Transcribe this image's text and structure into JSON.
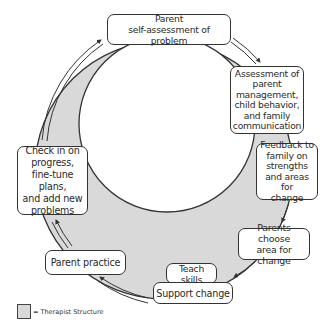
{
  "diagram": {
    "type": "cycle",
    "direction": "clockwise",
    "colors": {
      "therapist_structure_fill": "#d9d9d9",
      "stroke": "#333333",
      "background": "#ffffff"
    },
    "nodes": [
      {
        "id": "parent-self-assessment",
        "label": "Parent\nself-assessment of problem"
      },
      {
        "id": "assessment",
        "label": "Assessment of\nparent\nmanagement,\nchild behavior,\nand family\ncommunication"
      },
      {
        "id": "feedback",
        "label": "Feedback to\nfamily on\nstrengths\nand areas for\nchange"
      },
      {
        "id": "parents-choose",
        "label": "Parents choose\narea for change"
      },
      {
        "id": "teach-skills",
        "label": "Teach skills"
      },
      {
        "id": "support-change",
        "label": "Support change"
      },
      {
        "id": "parent-practice",
        "label": "Parent practice"
      },
      {
        "id": "check-in",
        "label": "Check in on\nprogress,\nfine-tune plans,\nand add new\nproblems"
      }
    ],
    "edges": [
      [
        "parent-self-assessment",
        "assessment"
      ],
      [
        "assessment",
        "feedback"
      ],
      [
        "feedback",
        "parents-choose"
      ],
      [
        "parents-choose",
        "support-change"
      ],
      [
        "support-change",
        "parent-practice"
      ],
      [
        "parent-practice",
        "check-in"
      ],
      [
        "check-in",
        "parent-self-assessment"
      ]
    ]
  },
  "legend": {
    "label": "= Therapist Structure"
  }
}
